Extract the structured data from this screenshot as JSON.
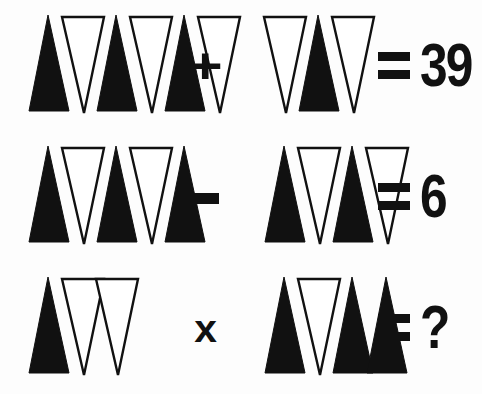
{
  "background_color": "#fdfdfd",
  "ink_color": "#111111",
  "shape_glyphs": {
    "black_up": "black-upright-triangle",
    "white_down": "white-inverted-triangle",
    "black_down": "black-inverted-triangle",
    "white_up": "white-upright-triangle"
  },
  "equations": [
    {
      "id": "equation-1",
      "left_group": {
        "label": "triangle-group-row1-left",
        "count": 6,
        "black_count": 3,
        "white_count": 3,
        "triangles": [
          {
            "fill": "black",
            "direction": "up"
          },
          {
            "fill": "white",
            "direction": "down"
          },
          {
            "fill": "black",
            "direction": "up"
          },
          {
            "fill": "white",
            "direction": "down"
          },
          {
            "fill": "black",
            "direction": "up"
          },
          {
            "fill": "white",
            "direction": "down"
          }
        ]
      },
      "operator": {
        "symbol": "+",
        "name": "plus"
      },
      "right_group": {
        "label": "triangle-group-row1-right",
        "count": 3,
        "black_count": 1,
        "white_count": 2,
        "triangles": [
          {
            "fill": "white",
            "direction": "down"
          },
          {
            "fill": "black",
            "direction": "up"
          },
          {
            "fill": "white",
            "direction": "down"
          }
        ]
      },
      "equals": "=",
      "result": "39"
    },
    {
      "id": "equation-2",
      "left_group": {
        "label": "triangle-group-row2-left",
        "count": 5,
        "black_count": 3,
        "white_count": 2,
        "triangles": [
          {
            "fill": "black",
            "direction": "up"
          },
          {
            "fill": "white",
            "direction": "down"
          },
          {
            "fill": "black",
            "direction": "up"
          },
          {
            "fill": "white",
            "direction": "down"
          },
          {
            "fill": "black",
            "direction": "up"
          }
        ]
      },
      "operator": {
        "symbol": "–",
        "name": "minus"
      },
      "right_group": {
        "label": "triangle-group-row2-right",
        "count": 4,
        "black_count": 2,
        "white_count": 2,
        "triangles": [
          {
            "fill": "black",
            "direction": "up"
          },
          {
            "fill": "white",
            "direction": "down"
          },
          {
            "fill": "black",
            "direction": "up"
          },
          {
            "fill": "white",
            "direction": "down"
          }
        ]
      },
      "equals": "=",
      "result": "6"
    },
    {
      "id": "equation-3",
      "left_group": {
        "label": "triangle-group-row3-left",
        "count": 3,
        "black_count": 1,
        "white_count": 2,
        "triangles": [
          {
            "fill": "black",
            "direction": "up"
          },
          {
            "fill": "white",
            "direction": "down"
          },
          {
            "fill": "white",
            "direction": "down"
          }
        ]
      },
      "operator": {
        "symbol": "x",
        "name": "times"
      },
      "right_group": {
        "label": "triangle-group-row3-right",
        "count": 4,
        "black_count": 3,
        "white_count": 1,
        "triangles": [
          {
            "fill": "black",
            "direction": "up"
          },
          {
            "fill": "white",
            "direction": "down"
          },
          {
            "fill": "black",
            "direction": "up"
          },
          {
            "fill": "black",
            "direction": "up"
          }
        ]
      },
      "equals": "=",
      "result": "?"
    }
  ]
}
